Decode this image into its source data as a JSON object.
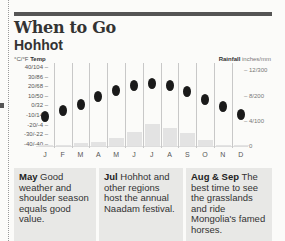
{
  "header": {
    "title": "When to Go",
    "subtitle": "Hohhot"
  },
  "axes": {
    "left_title_units": "°C/°F",
    "left_title": "Temp",
    "right_title": "Rainfall",
    "right_title_units": "inches/mm",
    "left_ticks": [
      "40/104 –",
      "30/86 –",
      "20/68 –",
      "10/50 –",
      "0/32 –",
      "-10/14 –",
      "-20/-4 –",
      "-30/-22 –",
      "-40/-40 –"
    ],
    "right_ticks": [
      "– 12/300",
      "– 8/200",
      "– 4/100",
      "– 0"
    ]
  },
  "months": [
    "J",
    "F",
    "M",
    "A",
    "M",
    "J",
    "J",
    "A",
    "S",
    "O",
    "N",
    "D"
  ],
  "chart_data": {
    "type": "bar+dot",
    "categories": [
      "Jan",
      "Feb",
      "Mar",
      "Apr",
      "May",
      "Jun",
      "Jul",
      "Aug",
      "Sep",
      "Oct",
      "Nov",
      "Dec"
    ],
    "series": [
      {
        "name": "Temp (°C)",
        "type": "dot",
        "values": [
          -12,
          -6,
          1,
          9,
          15,
          20,
          22,
          20,
          14,
          6,
          -2,
          -10
        ]
      },
      {
        "name": "Rainfall (inches)",
        "type": "bar",
        "values": [
          0.1,
          0.2,
          0.4,
          0.6,
          1.3,
          2.2,
          3.5,
          2.9,
          2.0,
          0.9,
          0.2,
          0.1
        ]
      }
    ],
    "ylabel_left": "°C/°F Temp",
    "ylabel_right": "Rainfall inches/mm",
    "ylim_left": [
      -40,
      40
    ],
    "ylim_right": [
      0,
      12
    ],
    "grid": false,
    "legend": "none"
  },
  "panels": [
    {
      "month": "May",
      "text": " Good weather and shoulder season equals good value."
    },
    {
      "month": "Jul",
      "text": " Hohhot and other regions host the annual Naadam festival."
    },
    {
      "month": "Aug & Sep",
      "text": " The best time to see the grasslands and ride Mongolia's famed horses."
    }
  ]
}
